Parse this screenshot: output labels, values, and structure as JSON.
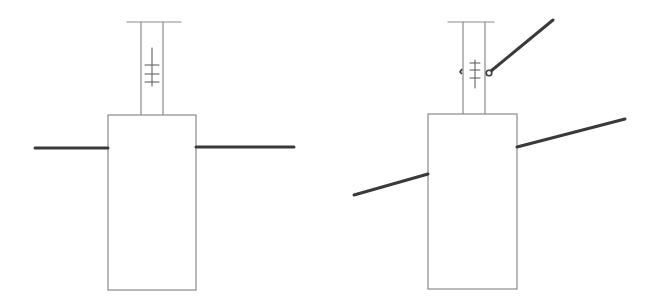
{
  "canvas": {
    "width": 656,
    "height": 307,
    "background": "#ffffff"
  },
  "colors": {
    "thin_stroke": "#8a8a8a",
    "thick_stroke": "#3a3a3a"
  },
  "panels": [
    {
      "name": "left-level-state",
      "top_bar": {
        "x1": 127,
        "x2": 181,
        "y": 22
      },
      "tube": {
        "x1": 141,
        "x2": 163,
        "y_top": 22,
        "y_bottom": 115
      },
      "gauge": {
        "x": 152,
        "y_top": 48,
        "y_bottom": 86,
        "ticks": [
          65,
          74,
          82
        ],
        "tick_half_width": 7
      },
      "box": {
        "x": 108,
        "y": 115,
        "width": 88,
        "height": 175
      },
      "beam_left": {
        "x1": 35,
        "y1": 148,
        "x2": 108,
        "y2": 148
      },
      "beam_right": {
        "x1": 196,
        "y1": 147,
        "x2": 294,
        "y2": 147
      }
    },
    {
      "name": "right-tilted-state",
      "top_bar": {
        "x1": 448,
        "x2": 494,
        "y": 22
      },
      "tube": {
        "x1": 463,
        "x2": 485,
        "y_top": 22,
        "y_bottom": 114
      },
      "gauge": {
        "x": 475,
        "y_top": 60,
        "y_bottom": 88,
        "ticks": [
          63,
          70,
          78
        ],
        "tick_half_width": 5
      },
      "side_mark": {
        "x": 462,
        "y": 72
      },
      "pivot": {
        "cx": 489,
        "cy": 73,
        "r": 2.8
      },
      "arm": {
        "x1": 491,
        "y1": 71,
        "x2": 553,
        "y2": 20
      },
      "box": {
        "x": 428,
        "y": 114,
        "width": 89,
        "height": 175
      },
      "beam_left": {
        "x1": 354,
        "y1": 195,
        "x2": 428,
        "y2": 174
      },
      "beam_right": {
        "x1": 517,
        "y1": 147,
        "x2": 625,
        "y2": 119
      }
    }
  ]
}
